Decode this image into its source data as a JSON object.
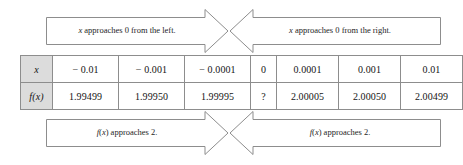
{
  "figure": {
    "name": "limit-table-figure"
  },
  "banners": {
    "top_left": {
      "text": "x approaches 0 from the left.",
      "direction": "right"
    },
    "top_right": {
      "text": "x approaches 0 from the right.",
      "direction": "left"
    },
    "bottom_left": {
      "text": "f(x) approaches 2.",
      "direction": "right"
    },
    "bottom_right": {
      "text": "f(x) approaches 2.",
      "direction": "left"
    }
  },
  "table": {
    "row_labels": [
      "x",
      "f(x)"
    ],
    "x_values": [
      "− 0.01",
      "− 0.001",
      "− 0.0001",
      "0",
      "0.0001",
      "0.001",
      "0.01"
    ],
    "fx_values": [
      "1.99499",
      "1.99950",
      "1.99995",
      "?",
      "2.00005",
      "2.00050",
      "2.00499"
    ]
  },
  "chart_data": {
    "type": "table",
    "xlabel": "x",
    "ylabel": "f(x)",
    "x": [
      -0.01,
      -0.001,
      -0.0001,
      0,
      0.0001,
      0.001,
      0.01
    ],
    "y": [
      1.99499,
      1.9995,
      1.99995,
      null,
      2.00005,
      2.0005,
      2.00499
    ],
    "annotations": [
      "x approaches 0 from the left.",
      "x approaches 0 from the right.",
      "f(x) approaches 2.",
      "f(x) approaches 2."
    ],
    "undefined_at": 0,
    "limit": 2
  },
  "colors": {
    "border": "#8d8d8d",
    "header_fill": "#dcdcdc",
    "text": "#141414",
    "background": "#ffffff"
  }
}
